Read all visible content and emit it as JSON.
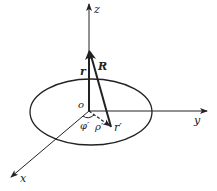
{
  "diagram": {
    "labels": {
      "z_axis": "z",
      "y_axis": "y",
      "x_axis": "x",
      "origin": "o",
      "r_vector": "r",
      "R_vector": "R",
      "r_prime": "r′",
      "rho_prime": "ρ′",
      "phi_prime": "φ′"
    },
    "colors": {
      "stroke": "#222222",
      "background": "#ffffff"
    }
  }
}
